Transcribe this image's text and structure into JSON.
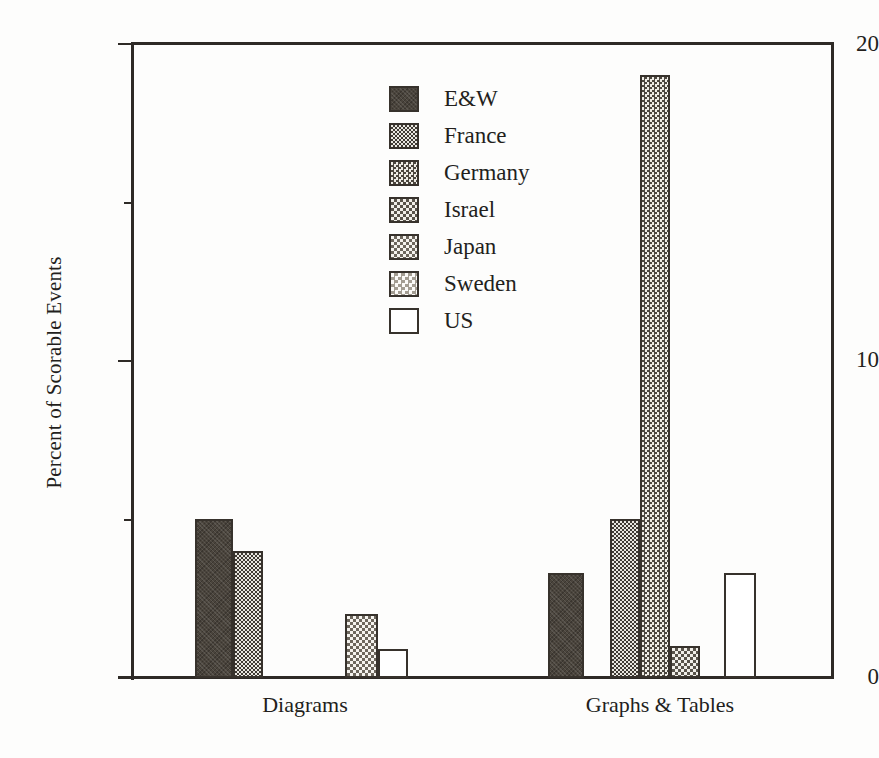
{
  "chart_data": {
    "type": "bar",
    "title": "",
    "xlabel": "",
    "ylabel": "Percent of Scorable Events",
    "ylim": [
      0,
      20
    ],
    "yticks": [
      0,
      10,
      20
    ],
    "ytick_labels": [
      "0",
      "10",
      "20"
    ],
    "yminor_ticks": [
      5,
      15
    ],
    "grid": false,
    "legend_position": "upper center",
    "categories": [
      "Diagrams",
      "Graphs & Tables"
    ],
    "series": [
      {
        "name": "E&W",
        "pattern": "solid-dark",
        "values": [
          5.0,
          3.3
        ]
      },
      {
        "name": "France",
        "pattern": "dense-check",
        "values": [
          4.0,
          5.0
        ]
      },
      {
        "name": "Germany",
        "pattern": "medium-check",
        "values": [
          0.0,
          19.0
        ]
      },
      {
        "name": "Israel",
        "pattern": "light-check",
        "values": [
          0.0,
          1.0
        ]
      },
      {
        "name": "Japan",
        "pattern": "fine-dots",
        "values": [
          2.0,
          0.0
        ]
      },
      {
        "name": "Sweden",
        "pattern": "very-light-dots",
        "values": [
          0.0,
          0.0
        ]
      },
      {
        "name": "US",
        "pattern": "white",
        "values": [
          0.9,
          3.3
        ]
      }
    ]
  },
  "axes": {
    "y_title": "Percent of Scorable Events",
    "y_labels": [
      {
        "value": 20,
        "text": "20"
      },
      {
        "value": 10,
        "text": "10"
      },
      {
        "value": 0,
        "text": "0"
      }
    ]
  },
  "legend": {
    "items": [
      {
        "label": "E&W"
      },
      {
        "label": "France"
      },
      {
        "label": "Germany"
      },
      {
        "label": "Israel"
      },
      {
        "label": "Japan"
      },
      {
        "label": "Sweden"
      },
      {
        "label": "US"
      }
    ]
  },
  "categories": [
    {
      "label": "Diagrams"
    },
    {
      "label": "Graphs & Tables"
    }
  ],
  "colors": {
    "ink": "#231f1c",
    "axis": "#2e2a26",
    "bar_outline": "#37322c",
    "background": "#fdfdfc"
  }
}
